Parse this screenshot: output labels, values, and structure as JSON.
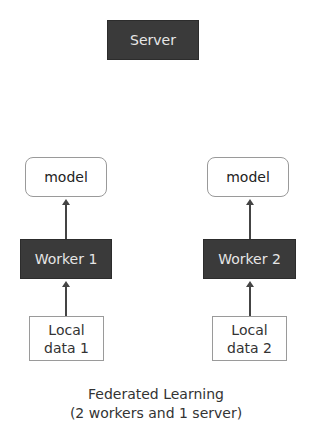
{
  "diagram": {
    "server": {
      "label": "Server",
      "fill": "#3a3a3a",
      "text_color": "#e6e6e6"
    },
    "workers": [
      {
        "model_label": "model",
        "worker_label": "Worker 1",
        "local_data_line1": "Local",
        "local_data_line2": "data 1"
      },
      {
        "model_label": "model",
        "worker_label": "Worker 2",
        "local_data_line1": "Local",
        "local_data_line2": "data 2"
      }
    ],
    "edges": [
      {
        "from": "Local data 1",
        "to": "Worker 1"
      },
      {
        "from": "Worker 1",
        "to": "model (1)"
      },
      {
        "from": "Local data 2",
        "to": "Worker 2"
      },
      {
        "from": "Worker 2",
        "to": "model (2)"
      }
    ],
    "caption": {
      "line1": "Federated Learning",
      "line2": "(2 workers and 1 server)"
    }
  }
}
